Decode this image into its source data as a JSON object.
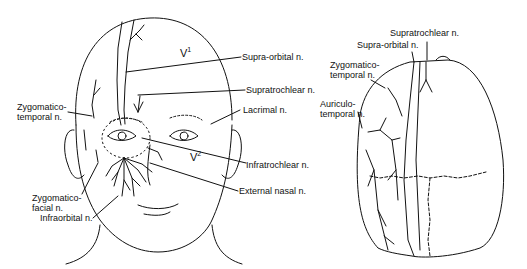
{
  "figure": {
    "left_panel": {
      "name": "frontal face view",
      "regions": {
        "v1": {
          "base": "V",
          "sup": "1"
        },
        "v2": {
          "base": "V",
          "sup": "2"
        }
      },
      "labels": {
        "supra_orbital": "Supra-orbital n.",
        "supratrochlear": "Supratrochlear n.",
        "lacrimal": "Lacrimal n.",
        "zygomaticotemporal_line1": "Zygomatico-",
        "zygomaticotemporal_line2": "temporal n.",
        "infratrochlear": "Infratrochlear n.",
        "external_nasal": "External nasal n.",
        "zygomaticofacial_line1": "Zygomatico-",
        "zygomaticofacial_line2": "facial n.",
        "infraorbital": "Infraorbital n."
      }
    },
    "right_panel": {
      "name": "superior scalp view",
      "labels": {
        "supratrochlear": "Supratrochlear n.",
        "supra_orbital": "Supra-orbital n.",
        "zygomaticotemporal_line1": "Zygomatico-",
        "zygomaticotemporal_line2": "temporal n.",
        "auriculotemporal_line1": "Auriculo-",
        "auriculotemporal_line2": "temporal n."
      }
    },
    "colors": {
      "ink": "#111111",
      "background": "#ffffff"
    }
  }
}
